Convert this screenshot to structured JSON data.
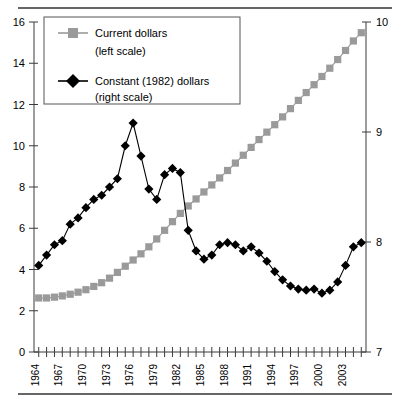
{
  "chart_data": {
    "type": "line",
    "title": "",
    "subtitle": "",
    "xlabel": "",
    "ylabel": "",
    "grid": false,
    "legend_position": "top-left",
    "x": [
      1964,
      1965,
      1966,
      1967,
      1968,
      1969,
      1970,
      1971,
      1972,
      1973,
      1974,
      1975,
      1976,
      1977,
      1978,
      1979,
      1980,
      1981,
      1982,
      1983,
      1984,
      1985,
      1986,
      1987,
      1988,
      1989,
      1990,
      1991,
      1992,
      1993,
      1994,
      1995,
      1996,
      1997,
      1998,
      1999,
      2000,
      2001,
      2002,
      2003,
      2004,
      2005
    ],
    "x_tick_labels": [
      "1964",
      "1967",
      "1970",
      "1973",
      "1976",
      "1979",
      "1982",
      "1985",
      "1988",
      "1991",
      "1994",
      "1997",
      "2000",
      "2003"
    ],
    "x_tick_years": [
      1964,
      1967,
      1970,
      1973,
      1976,
      1979,
      1982,
      1985,
      1988,
      1991,
      1994,
      1997,
      2000,
      2003
    ],
    "xlim": [
      1963.4,
      2005.6
    ],
    "axes": [
      {
        "id": "left",
        "name": "left scale",
        "ylim": [
          0,
          16
        ],
        "ticks": [
          0,
          2,
          4,
          6,
          8,
          10,
          12,
          14,
          16
        ],
        "tick_labels": [
          "0",
          "2",
          "4",
          "6",
          "8",
          "10",
          "12",
          "14",
          "16"
        ]
      },
      {
        "id": "right",
        "name": "right scale",
        "ylim": [
          7,
          10
        ],
        "ticks": [
          7,
          8,
          9,
          10
        ],
        "tick_labels": [
          "7",
          "8",
          "9",
          "10"
        ]
      }
    ],
    "series": [
      {
        "name": "Current dollars",
        "legend_label": "Current dollars",
        "legend_sublabel": "(left scale)",
        "axis": "left",
        "color": "#9a9a9a",
        "marker": "square",
        "values": [
          2.62,
          2.62,
          2.66,
          2.72,
          2.8,
          2.9,
          3.02,
          3.18,
          3.36,
          3.58,
          3.86,
          4.16,
          4.46,
          4.76,
          5.1,
          5.48,
          5.9,
          6.32,
          6.72,
          7.08,
          7.42,
          7.76,
          8.1,
          8.44,
          8.8,
          9.16,
          9.54,
          9.92,
          10.3,
          10.66,
          11.02,
          11.4,
          11.8,
          12.2,
          12.58,
          12.96,
          13.36,
          13.76,
          14.18,
          14.62,
          15.08,
          15.48
        ]
      },
      {
        "name": "Constant (1982) dollars",
        "legend_label": "Constant (1982) dollars",
        "legend_sublabel": "(right scale)",
        "axis": "right",
        "color": "#000000",
        "values_left_scale": [
          4.2,
          4.7,
          5.2,
          5.4,
          6.2,
          6.5,
          7.0,
          7.4,
          7.6,
          8.0,
          8.4,
          10.0,
          11.1,
          9.5,
          7.9,
          7.4,
          8.6,
          8.9,
          8.7,
          5.9,
          4.9,
          4.5,
          4.7,
          5.2,
          5.3,
          5.2,
          4.9,
          5.1,
          4.8,
          4.4,
          3.9,
          3.5,
          3.2,
          3.05,
          3.0,
          3.05,
          2.85,
          3.0,
          3.4,
          4.2,
          5.1,
          5.3
        ],
        "values": [
          7.79,
          7.88,
          7.98,
          8.01,
          8.16,
          8.22,
          8.31,
          8.39,
          8.43,
          8.5,
          8.58,
          8.88,
          9.08,
          8.78,
          8.48,
          8.39,
          8.61,
          8.67,
          8.63,
          8.11,
          7.92,
          7.84,
          7.88,
          7.98,
          7.99,
          7.98,
          7.92,
          7.96,
          7.9,
          7.83,
          7.73,
          7.66,
          7.6,
          7.57,
          7.56,
          7.57,
          7.53,
          7.56,
          7.64,
          7.79,
          7.96,
          7.99
        ]
      }
    ],
    "series_constant_tail": {
      "comment_free": true
    }
  },
  "legend": {
    "entries": [
      {
        "label": "Current dollars",
        "sublabel": "(left scale)",
        "marker": "square",
        "color": "#9a9a9a"
      },
      {
        "label": "Constant (1982) dollars",
        "sublabel": "(right scale)",
        "marker": "diamond",
        "color": "#000000"
      }
    ]
  }
}
